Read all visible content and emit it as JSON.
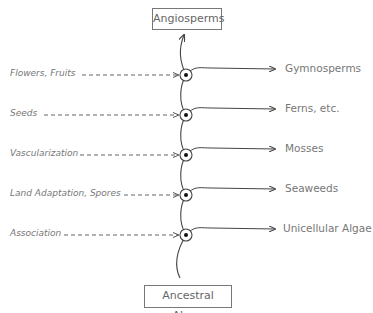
{
  "diagram": {
    "top_box": "Angiosperms",
    "bottom_box": "Ancestral Algae",
    "traits": [
      {
        "label": "Flowers, Fruits"
      },
      {
        "label": "Seeds"
      },
      {
        "label": "Vascularization"
      },
      {
        "label": "Land Adaptation, Spores"
      },
      {
        "label": "Association"
      }
    ],
    "groups": [
      {
        "label": "Gymnosperms"
      },
      {
        "label": "Ferns, etc."
      },
      {
        "label": "Mosses"
      },
      {
        "label": "Seaweeds"
      },
      {
        "label": "Unicellular Algae"
      }
    ],
    "colors": {
      "line": "#444444",
      "text": "#777777"
    }
  }
}
